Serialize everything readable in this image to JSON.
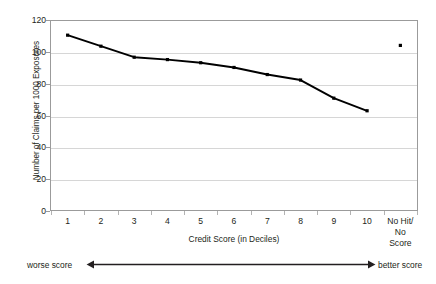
{
  "chart_data": {
    "type": "line",
    "title": "",
    "xlabel": "Credit Score (in Deciles)",
    "ylabel": "Number of Claims per 1000 Exposures",
    "categories": [
      "1",
      "2",
      "3",
      "4",
      "5",
      "6",
      "7",
      "8",
      "9",
      "10",
      "No Hit/\nNo Score"
    ],
    "series": [
      {
        "name": "Claims per 1000 Exposures by credit score decile",
        "marker": "square",
        "color": "#000000",
        "values": [
          111,
          104,
          97,
          95.5,
          93.5,
          90.5,
          86,
          82.5,
          71,
          63,
          null
        ]
      },
      {
        "name": "No Hit / No Score",
        "marker": "square",
        "color": "#000000",
        "line": false,
        "values": [
          null,
          null,
          null,
          null,
          null,
          null,
          null,
          null,
          null,
          null,
          104.5
        ]
      }
    ],
    "ylim": [
      0,
      120
    ],
    "ytick_values": [
      0,
      20,
      40,
      60,
      80,
      100,
      120
    ],
    "ytick_labels": [
      "0",
      "20",
      "40",
      "60",
      "80",
      "100",
      "120"
    ],
    "grid": "horizontal",
    "legend": "none",
    "annotations": {
      "left_label": "worse score",
      "right_label": "better score",
      "arrow": "double-headed-horizontal"
    }
  },
  "colors": {
    "series": "#000000",
    "gridline": "#d6d6d6",
    "frame": "#9b9b9b",
    "text": "#231f20",
    "background": "#ffffff"
  }
}
